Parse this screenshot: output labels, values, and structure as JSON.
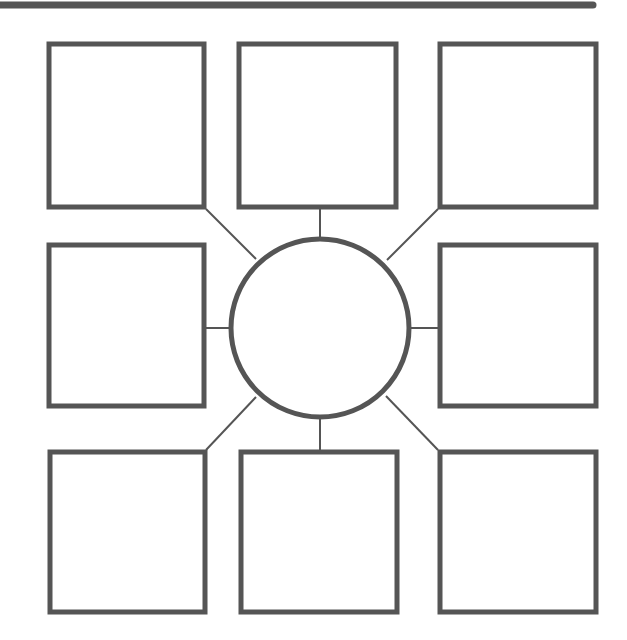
{
  "diagram": {
    "type": "spider-map",
    "colors": {
      "stroke": "#555555",
      "background": "#ffffff"
    },
    "top_bar": {
      "x1": 0,
      "x2": 593,
      "y": 5,
      "width": 7
    },
    "center": {
      "label": "",
      "cx": 320,
      "cy": 328,
      "r": 89
    },
    "boxes": [
      {
        "id": "top-left",
        "label": "",
        "x": 49,
        "y": 44,
        "w": 155,
        "h": 163
      },
      {
        "id": "top-center",
        "label": "",
        "x": 239,
        "y": 44,
        "w": 157,
        "h": 163
      },
      {
        "id": "top-right",
        "label": "",
        "x": 440,
        "y": 44,
        "w": 156,
        "h": 163
      },
      {
        "id": "middle-left",
        "label": "",
        "x": 49,
        "y": 245,
        "w": 155,
        "h": 161
      },
      {
        "id": "middle-right",
        "label": "",
        "x": 440,
        "y": 245,
        "w": 156,
        "h": 161
      },
      {
        "id": "bottom-left",
        "label": "",
        "x": 50,
        "y": 452,
        "w": 155,
        "h": 160
      },
      {
        "id": "bottom-center",
        "label": "",
        "x": 241,
        "y": 452,
        "w": 156,
        "h": 160
      },
      {
        "id": "bottom-right",
        "label": "",
        "x": 440,
        "y": 452,
        "w": 156,
        "h": 160
      }
    ],
    "connectors": [
      {
        "to": "top-left",
        "x1": 206,
        "y1": 209,
        "x2": 256,
        "y2": 259
      },
      {
        "to": "top-center",
        "x1": 320,
        "y1": 209,
        "x2": 320,
        "y2": 239
      },
      {
        "to": "top-right",
        "x1": 438,
        "y1": 209,
        "x2": 387,
        "y2": 260
      },
      {
        "to": "middle-left",
        "x1": 206,
        "y1": 328,
        "x2": 231,
        "y2": 328
      },
      {
        "to": "middle-right",
        "x1": 409,
        "y1": 328,
        "x2": 438,
        "y2": 328
      },
      {
        "to": "bottom-left",
        "x1": 206,
        "y1": 450,
        "x2": 256,
        "y2": 397
      },
      {
        "to": "bottom-center",
        "x1": 320,
        "y1": 417,
        "x2": 320,
        "y2": 450
      },
      {
        "to": "bottom-right",
        "x1": 438,
        "y1": 450,
        "x2": 386,
        "y2": 396
      }
    ]
  }
}
